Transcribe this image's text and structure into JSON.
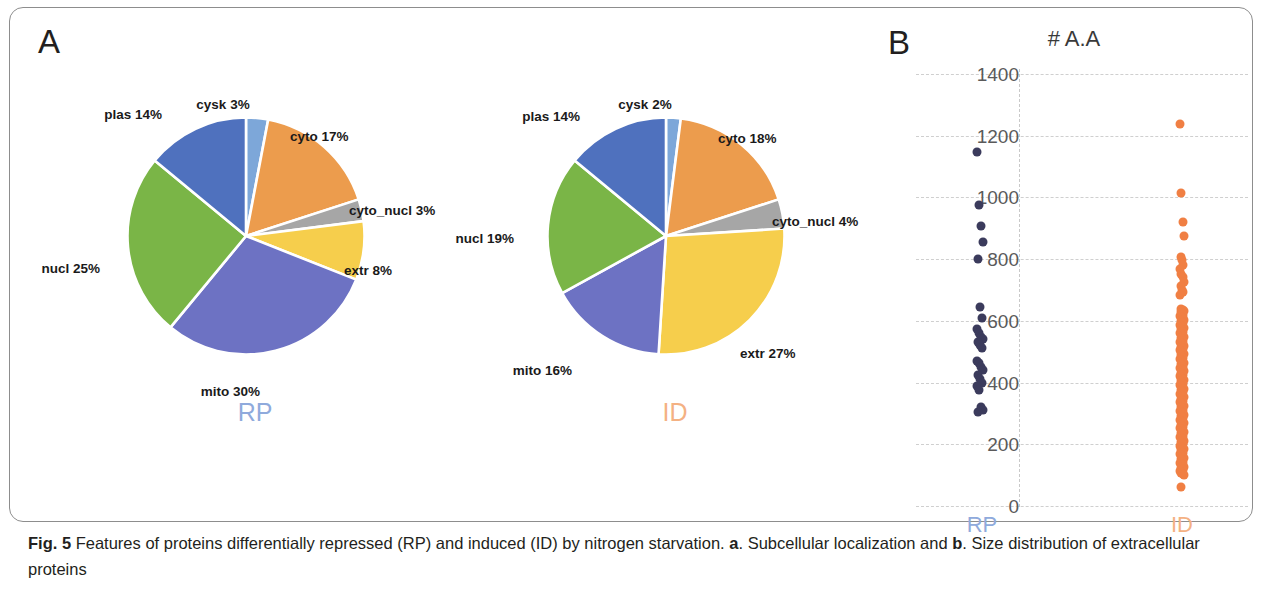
{
  "figure": {
    "panel_a_letter": "A",
    "panel_b_letter": "B",
    "caption_prefix": "Fig. 5",
    "caption_part1": " Features of proteins differentially repressed (RP) and induced (ID) by nitrogen starvation. ",
    "caption_bold_a": "a",
    "caption_part2": ". Subcellular localization and ",
    "caption_bold_b": "b",
    "caption_part3": ". Size distribution of extracellular proteins"
  },
  "colors": {
    "plas": "#4f71be",
    "cysk": "#7da7d9",
    "cyto": "#ec9c4d",
    "cyto_nucl": "#a6a6a6",
    "extr": "#f6ce4c",
    "mito": "#6d72c3",
    "nucl": "#7ab547",
    "rp_label": "#8faadc",
    "id_label": "#f4b183",
    "rp_dot": "#3b3b5c",
    "id_dot": "#f07f43"
  },
  "chart_data": [
    {
      "type": "pie",
      "title": "RP",
      "name": "rp-subcellular-localization",
      "categories": [
        "cysk",
        "cyto",
        "cyto_nucl",
        "extr",
        "mito",
        "nucl",
        "plas"
      ],
      "values": [
        3,
        17,
        3,
        8,
        30,
        25,
        14
      ],
      "labels": [
        "cysk 3%",
        "cyto 17%",
        "cyto_nucl 3%",
        "extr 8%",
        "mito 30%",
        "nucl 25%",
        "plas 14%"
      ],
      "unit": "%"
    },
    {
      "type": "pie",
      "title": "ID",
      "name": "id-subcellular-localization",
      "categories": [
        "cysk",
        "cyto",
        "cyto_nucl",
        "extr",
        "mito",
        "nucl",
        "plas"
      ],
      "values": [
        2,
        18,
        4,
        27,
        16,
        19,
        14
      ],
      "labels": [
        "cysk 2%",
        "cyto 18%",
        "cyto_nucl 4%",
        "extr 27%",
        "mito 16%",
        "nucl 19%",
        "plas 14%"
      ],
      "unit": "%"
    },
    {
      "type": "scatter",
      "name": "size-distribution-extracellular-proteins",
      "title": "# A.A",
      "xlabel": "",
      "ylabel": "",
      "ylim": [
        0,
        1400
      ],
      "yticks": [
        0,
        200,
        400,
        600,
        800,
        1000,
        1200,
        1400
      ],
      "grid": true,
      "x_categories": [
        "RP",
        "ID"
      ],
      "series": [
        {
          "name": "RP",
          "values": [
            1148,
            975,
            907,
            855,
            800,
            645,
            610,
            575,
            560,
            548,
            540,
            530,
            522,
            512,
            470,
            462,
            452,
            440,
            425,
            412,
            400,
            388,
            375,
            320,
            312,
            305
          ]
        },
        {
          "name": "ID",
          "values": [
            1238,
            1015,
            920,
            875,
            808,
            798,
            782,
            768,
            752,
            742,
            726,
            712,
            700,
            692,
            684,
            640,
            636,
            632,
            628,
            624,
            620,
            616,
            612,
            608,
            604,
            600,
            596,
            592,
            588,
            584,
            580,
            576,
            572,
            568,
            564,
            560,
            556,
            552,
            548,
            544,
            540,
            536,
            532,
            528,
            524,
            520,
            516,
            512,
            508,
            504,
            500,
            496,
            492,
            488,
            484,
            480,
            476,
            472,
            468,
            464,
            460,
            456,
            452,
            448,
            444,
            440,
            436,
            432,
            428,
            424,
            420,
            416,
            412,
            408,
            404,
            400,
            396,
            392,
            388,
            384,
            380,
            376,
            372,
            368,
            364,
            360,
            356,
            352,
            348,
            344,
            340,
            336,
            332,
            328,
            324,
            320,
            316,
            312,
            308,
            304,
            300,
            296,
            292,
            288,
            284,
            280,
            276,
            272,
            268,
            264,
            260,
            256,
            252,
            248,
            244,
            240,
            236,
            232,
            228,
            224,
            220,
            216,
            212,
            208,
            204,
            200,
            196,
            192,
            188,
            184,
            180,
            176,
            172,
            168,
            164,
            160,
            156,
            152,
            148,
            144,
            140,
            136,
            132,
            128,
            124,
            120,
            116,
            112,
            108,
            104,
            100,
            62
          ]
        }
      ]
    }
  ]
}
